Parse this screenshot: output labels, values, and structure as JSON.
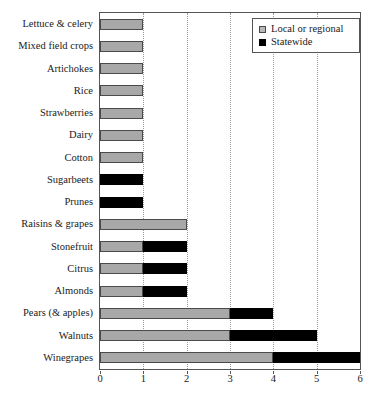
{
  "chart_data": {
    "type": "bar",
    "orientation": "horizontal",
    "stacked": true,
    "title": "",
    "xlabel": "",
    "ylabel": "",
    "xlim": [
      0,
      6
    ],
    "xticks": [
      0,
      1,
      2,
      3,
      4,
      5,
      6
    ],
    "xtick_labels": [
      "0",
      "1",
      "2",
      "3",
      "4",
      "5",
      "6"
    ],
    "grid": "vertical-dotted",
    "legend_position": "top-right",
    "categories": [
      "Lettuce & celery",
      "Mixed field crops",
      "Artichokes",
      "Rice",
      "Strawberries",
      "Dairy",
      "Cotton",
      "Sugarbeets",
      "Prunes",
      "Raisins & grapes",
      "Stonefruit",
      "Citrus",
      "Almonds",
      "Pears (& apples)",
      "Walnuts",
      "Winegrapes"
    ],
    "series": [
      {
        "name": "Local or regional",
        "color": "#a8a8a8",
        "values": [
          1,
          1,
          1,
          1,
          1,
          1,
          1,
          0,
          0,
          2,
          1,
          1,
          1,
          3,
          3,
          4
        ]
      },
      {
        "name": "Statewide",
        "color": "#000000",
        "values": [
          0,
          0,
          0,
          0,
          0,
          0,
          0,
          1,
          1,
          0,
          1,
          1,
          1,
          1,
          2,
          2
        ]
      }
    ],
    "totals": [
      1,
      1,
      1,
      1,
      1,
      1,
      1,
      1,
      1,
      2,
      2,
      2,
      2,
      4,
      5,
      6
    ]
  },
  "legend": {
    "entries": [
      {
        "label": "Local or regional",
        "swatch": "local"
      },
      {
        "label": "Statewide",
        "swatch": "state"
      }
    ]
  },
  "colors": {
    "local": "#a8a8a8",
    "statewide": "#000000",
    "axis": "#555555",
    "grid": "#9a9a9a",
    "background": "#ffffff"
  }
}
